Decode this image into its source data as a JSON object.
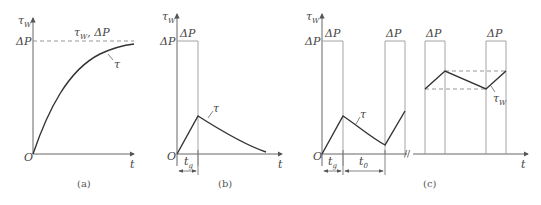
{
  "figure": {
    "panels": [
      {
        "id": "a",
        "caption": "(a)",
        "y_axis_label": "τ",
        "y_axis_label_sub": "W",
        "y_tick": "ΔP",
        "origin": "O",
        "x_axis_label": "t",
        "dashed_line_label": "τ",
        "dashed_line_label_sub": "W",
        "dashed_line_label_tail": ", ΔP",
        "curve_label": "τ"
      },
      {
        "id": "b",
        "caption": "(b)",
        "y_axis_label": "τ",
        "y_axis_label_sub": "W",
        "y_tick": "ΔP",
        "pulse_label": "ΔP",
        "origin": "O",
        "x_axis_label": "t",
        "curve_label": "τ",
        "interval_label": "t",
        "interval_label_sub": "g"
      },
      {
        "id": "c",
        "caption": "(c)",
        "y_axis_label": "τ",
        "y_axis_label_sub": "W",
        "y_tick": "ΔP",
        "pulse_labels": [
          "ΔP",
          "ΔP",
          "ΔP",
          "ΔP"
        ],
        "origin": "O",
        "x_axis_label": "t",
        "curve_label": "τ",
        "steady_label": "τ",
        "steady_label_sub": "W",
        "interval_label_1": "t",
        "interval_label_1_sub": "g",
        "interval_label_2": "t",
        "interval_label_2_sub": "0",
        "break_mark": "//"
      }
    ]
  }
}
